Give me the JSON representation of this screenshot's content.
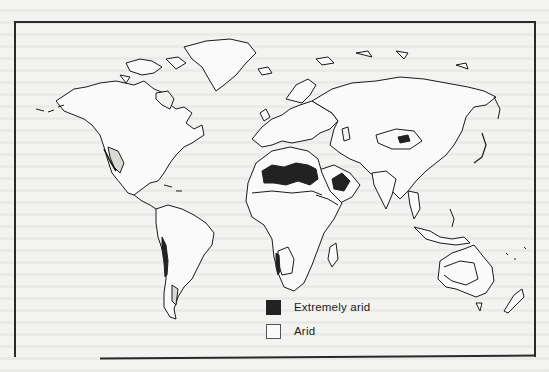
{
  "figure": {
    "type": "world-map",
    "colors": {
      "background": "#f3f3f1",
      "extremely_arid": "#222222",
      "arid": "#fafafa",
      "outline": "#1a1a1a",
      "frame": "#2a2a2a"
    }
  },
  "legend": {
    "items": [
      {
        "label": "Extremely arid",
        "swatch": "dark"
      },
      {
        "label": "Arid",
        "swatch": "light"
      }
    ]
  },
  "map_regions": {
    "extremely_arid": [
      "Sahara",
      "Arabian Peninsula (Rub' al Khali)",
      "Taklamakan",
      "Atacama/Peru coast",
      "Namib"
    ],
    "arid": [
      "North Africa / Sahel",
      "Middle East",
      "Central Asia",
      "Southwestern North America",
      "Western South America",
      "Patagonia",
      "Kalahari",
      "Australian interior"
    ]
  }
}
